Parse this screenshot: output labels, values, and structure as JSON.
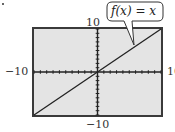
{
  "chart_data": {
    "type": "line",
    "title": "",
    "function_label": "f(x) = x",
    "xlabel": "",
    "ylabel": "",
    "xlim": [
      -10,
      10
    ],
    "ylim": [
      -10,
      10
    ],
    "x_tick_step": 1,
    "y_tick_step": 1,
    "grid": false,
    "window_labels": {
      "xmin": "−10",
      "xmax": "10",
      "ymin": "−10",
      "ymax": "10"
    },
    "series": [
      {
        "name": "f(x) = x",
        "x": [
          -10,
          10
        ],
        "y": [
          -10,
          10
        ]
      }
    ],
    "annotation": {
      "text": "f(x) = x",
      "points_to": [
        8,
        6
      ]
    }
  },
  "colors": {
    "plot_background": "#e4e4e4",
    "frame": "#3a3a3a",
    "axis": "#222222",
    "line": "#222222"
  }
}
